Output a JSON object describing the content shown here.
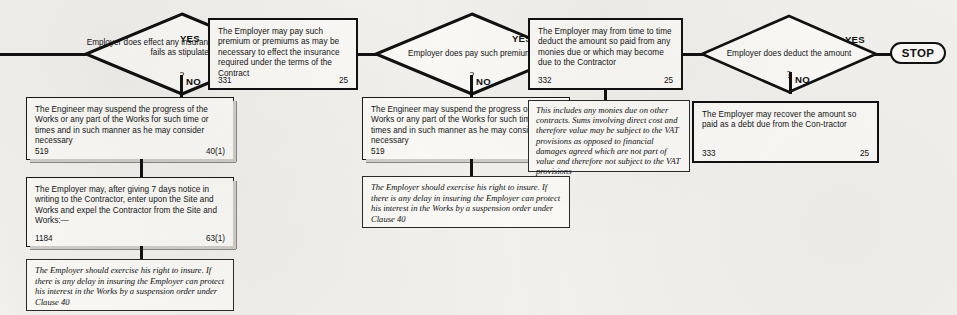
{
  "diagram": {
    "type": "flowchart",
    "title_visible": false,
    "colors": {
      "ink": "#111111",
      "paper": "#f2f1ee",
      "box_fill": "#fbfaf7"
    },
    "labels": {
      "yes": "YES",
      "no": "NO",
      "question_mark": "?"
    },
    "terminator": {
      "label": "STOP"
    },
    "decisions": [
      {
        "id": "d1",
        "text": "Employer does effect any insurance if the Contractor fails as stipulated"
      },
      {
        "id": "d2",
        "text": "Employer does pay such premiums"
      },
      {
        "id": "d3",
        "text": "Employer does deduct the amount"
      }
    ],
    "process_boxes": [
      {
        "id": "p331",
        "text": "The Employer may pay such premium or premiums as may be necessary to effect the insurance required under the terms of the Contract",
        "ref": "331",
        "clause": "25"
      },
      {
        "id": "p332",
        "text": "The Employer may from time to time deduct the amount so paid from any monies due or which may become due to the Contractor",
        "ref": "332",
        "clause": "25"
      },
      {
        "id": "p333",
        "text": "The Employer may recover the amount so paid as a debt due from the Con-tractor",
        "ref": "333",
        "clause": "25"
      },
      {
        "id": "p519a",
        "text": "The Engineer may suspend the progress of the Works or any part of the Works for such time or times and in such manner as he may consider necessary",
        "ref": "519",
        "clause": "40(1)"
      },
      {
        "id": "p1184",
        "text": "The Employer may, after giving 7 days notice in writing to the Contractor, enter upon the Site and Works and expel the Contractor from the Site and Works:—",
        "ref": "1184",
        "clause": "63(1)"
      },
      {
        "id": "p519b",
        "text": "The Engineer may suspend the progress of the Works or any part of the Works for such time or times and in such manner as he may consider necessary",
        "ref": "519",
        "clause": "40(1)"
      }
    ],
    "notes": [
      {
        "id": "n1",
        "text": "The Employer should exercise his right to insure. If there is any delay in insuring the Employer can protect his interest in the Works by a suspension order under Clause 40"
      },
      {
        "id": "n2",
        "text": "The Employer should exercise his right to insure. If there is any delay in insuring the Employer can protect his interest in the Works by a suspension order under Clause 40"
      },
      {
        "id": "n3",
        "text": "This includes any monies due on other contracts. Sums involving direct cost and therefore value may be subject to the VAT provisions as opposed to financial damages agreed which are not part of value and therefore not subject to the VAT provisions"
      }
    ]
  }
}
